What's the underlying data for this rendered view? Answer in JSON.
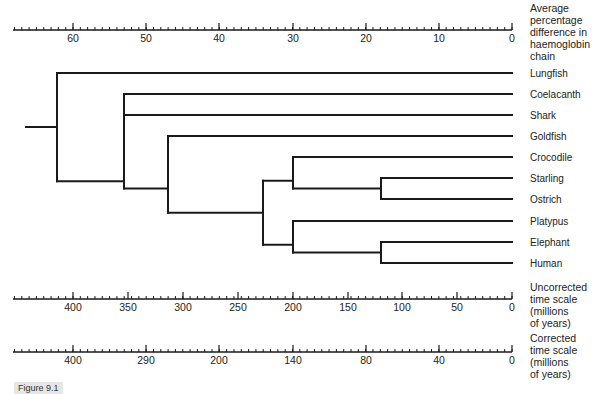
{
  "figure": {
    "caption": "Figure 9.1"
  },
  "axes": {
    "haemoglobin": {
      "label_lines": [
        "Average",
        "percentage",
        "difference in",
        "haemoglobin",
        "chain"
      ],
      "ticks": [
        {
          "value": "60",
          "x": 73
        },
        {
          "value": "50",
          "x": 146
        },
        {
          "value": "40",
          "x": 219
        },
        {
          "value": "30",
          "x": 293
        },
        {
          "value": "20",
          "x": 366
        },
        {
          "value": "10",
          "x": 439
        },
        {
          "value": "0",
          "x": 512
        }
      ],
      "y": 30
    },
    "uncorrected": {
      "label_lines": [
        "Uncorrected",
        "time scale",
        "(millions",
        "of years)"
      ],
      "ticks": [
        {
          "value": "400",
          "x": 73
        },
        {
          "value": "350",
          "x": 128
        },
        {
          "value": "300",
          "x": 183
        },
        {
          "value": "250",
          "x": 238
        },
        {
          "value": "200",
          "x": 293
        },
        {
          "value": "150",
          "x": 348
        },
        {
          "value": "100",
          "x": 402
        },
        {
          "value": "50",
          "x": 457
        },
        {
          "value": "0",
          "x": 512
        }
      ],
      "y": 299
    },
    "corrected": {
      "label_lines": [
        "Corrected",
        "time scale",
        "(millions",
        "of years)"
      ],
      "ticks": [
        {
          "value": "400",
          "x": 73
        },
        {
          "value": "290",
          "x": 146
        },
        {
          "value": "200",
          "x": 219
        },
        {
          "value": "140",
          "x": 293
        },
        {
          "value": "80",
          "x": 366
        },
        {
          "value": "40",
          "x": 439
        },
        {
          "value": "0",
          "x": 512
        }
      ],
      "y": 352
    }
  },
  "tree": {
    "leaves": [
      {
        "name": "Lungfish",
        "y": 73
      },
      {
        "name": "Coelacanth",
        "y": 94
      },
      {
        "name": "Shark",
        "y": 115
      },
      {
        "name": "Goldfish",
        "y": 136
      },
      {
        "name": "Crocodile",
        "y": 157
      },
      {
        "name": "Starling",
        "y": 178
      },
      {
        "name": "Ostrich",
        "y": 199
      },
      {
        "name": "Platypus",
        "y": 221
      },
      {
        "name": "Elephant",
        "y": 242
      },
      {
        "name": "Human",
        "y": 263
      }
    ],
    "divergence_percent": {
      "root": 62,
      "Lungfish_vs_rest": 62,
      "Coelacanth_Shark_vs_rest": 53,
      "Goldfish_vs_tetrapods": 47,
      "Reptile_Bird_vs_Mammal": 34,
      "Crocodile_vs_Birds": 30,
      "Starling_vs_Ostrich": 18,
      "Platypus_vs_Placental": 30,
      "Elephant_vs_Human": 18
    }
  }
}
